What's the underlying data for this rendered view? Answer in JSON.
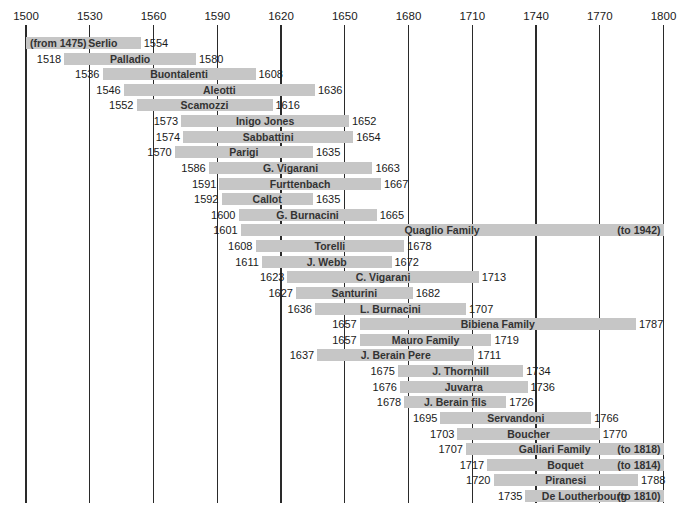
{
  "chart_data": {
    "type": "bar",
    "subtype": "timeline-gantt",
    "title": "",
    "xlabel": "",
    "ylabel": "",
    "xlim": [
      1500,
      1800
    ],
    "grid": true,
    "x_ticks": [
      1500,
      1530,
      1560,
      1590,
      1620,
      1650,
      1680,
      1710,
      1740,
      1770,
      1800
    ],
    "bar_color": "#c6c6c6",
    "rows": [
      {
        "name": "Serlio",
        "start": 1475,
        "end": 1554,
        "start_label": "(from 1475)",
        "end_label": "1554",
        "start_inside": true
      },
      {
        "name": "Palladio",
        "start": 1518,
        "end": 1580,
        "start_label": "1518",
        "end_label": "1580"
      },
      {
        "name": "Buontalenti",
        "start": 1536,
        "end": 1608,
        "start_label": "1536",
        "end_label": "1608"
      },
      {
        "name": "Aleotti",
        "start": 1546,
        "end": 1636,
        "start_label": "1546",
        "end_label": "1636"
      },
      {
        "name": "Scamozzi",
        "start": 1552,
        "end": 1616,
        "start_label": "1552",
        "end_label": "1616"
      },
      {
        "name": "Inigo Jones",
        "start": 1573,
        "end": 1652,
        "start_label": "1573",
        "end_label": "1652"
      },
      {
        "name": "Sabbattini",
        "start": 1574,
        "end": 1654,
        "start_label": "1574",
        "end_label": "1654"
      },
      {
        "name": "Parigi",
        "start": 1570,
        "end": 1635,
        "start_label": "1570",
        "end_label": "1635"
      },
      {
        "name": "G. Vigarani",
        "start": 1586,
        "end": 1663,
        "start_label": "1586",
        "end_label": "1663"
      },
      {
        "name": "Furttenbach",
        "start": 1591,
        "end": 1667,
        "start_label": "1591",
        "end_label": "1667"
      },
      {
        "name": "Callot",
        "start": 1592,
        "end": 1635,
        "start_label": "1592",
        "end_label": "1635"
      },
      {
        "name": "G. Burnacini",
        "start": 1600,
        "end": 1665,
        "start_label": "1600",
        "end_label": "1665"
      },
      {
        "name": "Quaglio Family",
        "start": 1601,
        "end": 1942,
        "start_label": "1601",
        "end_label": "(to 1942)",
        "end_inside": true
      },
      {
        "name": "Torelli",
        "start": 1608,
        "end": 1678,
        "start_label": "1608",
        "end_label": "1678"
      },
      {
        "name": "J. Webb",
        "start": 1611,
        "end": 1672,
        "start_label": "1611",
        "end_label": "1672"
      },
      {
        "name": "C. Vigarani",
        "start": 1623,
        "end": 1713,
        "start_label": "1623",
        "end_label": "1713"
      },
      {
        "name": "Santurini",
        "start": 1627,
        "end": 1682,
        "start_label": "1627",
        "end_label": "1682"
      },
      {
        "name": "L. Burnacini",
        "start": 1636,
        "end": 1707,
        "start_label": "1636",
        "end_label": "1707"
      },
      {
        "name": "Bibiena Family",
        "start": 1657,
        "end": 1787,
        "start_label": "1657",
        "end_label": "1787"
      },
      {
        "name": "Mauro Family",
        "start": 1657,
        "end": 1719,
        "start_label": "1657",
        "end_label": "1719"
      },
      {
        "name": "J. Berain Pere",
        "start": 1637,
        "end": 1711,
        "start_label": "1637",
        "end_label": "1711"
      },
      {
        "name": "J. Thornhill",
        "start": 1675,
        "end": 1734,
        "start_label": "1675",
        "end_label": "1734"
      },
      {
        "name": "Juvarra",
        "start": 1676,
        "end": 1736,
        "start_label": "1676",
        "end_label": "1736"
      },
      {
        "name": "J. Berain fils",
        "start": 1678,
        "end": 1726,
        "start_label": "1678",
        "end_label": "1726"
      },
      {
        "name": "Servandoni",
        "start": 1695,
        "end": 1766,
        "start_label": "1695",
        "end_label": "1766"
      },
      {
        "name": "Boucher",
        "start": 1703,
        "end": 1770,
        "start_label": "1703",
        "end_label": "1770"
      },
      {
        "name": "Galliari Family",
        "start": 1707,
        "end": 1818,
        "start_label": "1707",
        "end_label": "(to 1818)",
        "end_inside": true
      },
      {
        "name": "Boquet",
        "start": 1717,
        "end": 1814,
        "start_label": "1717",
        "end_label": "(to 1814)",
        "end_inside": true
      },
      {
        "name": "Piranesi",
        "start": 1720,
        "end": 1788,
        "start_label": "1720",
        "end_label": "1788"
      },
      {
        "name": "De Loutherbourg",
        "start": 1735,
        "end": 1810,
        "start_label": "1735",
        "end_label": "(to 1810)",
        "end_inside": true
      }
    ]
  }
}
